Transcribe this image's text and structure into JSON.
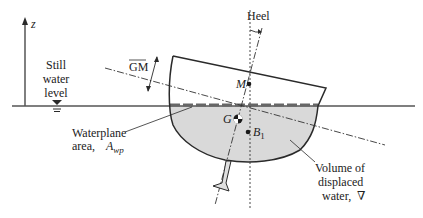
{
  "figure": {
    "axis_label": "z",
    "heel_label": "Heel",
    "gm_label": "GM",
    "still_water_label": [
      "Still",
      "water",
      "level"
    ],
    "points": {
      "metacenter": "M",
      "center_of_gravity": "G",
      "center_of_buoyancy": "B",
      "center_of_buoyancy_subscript": "1"
    },
    "waterplane_label": [
      "Waterplane",
      "area,"
    ],
    "waterplane_symbol": "A",
    "waterplane_subscript": "wp",
    "volume_label": [
      "Volume of",
      "displaced",
      "water,"
    ],
    "volume_symbol": "∇"
  },
  "colors": {
    "line": "#2a2a2a",
    "water_fill": "#d9d9d9",
    "background": "#ffffff"
  }
}
